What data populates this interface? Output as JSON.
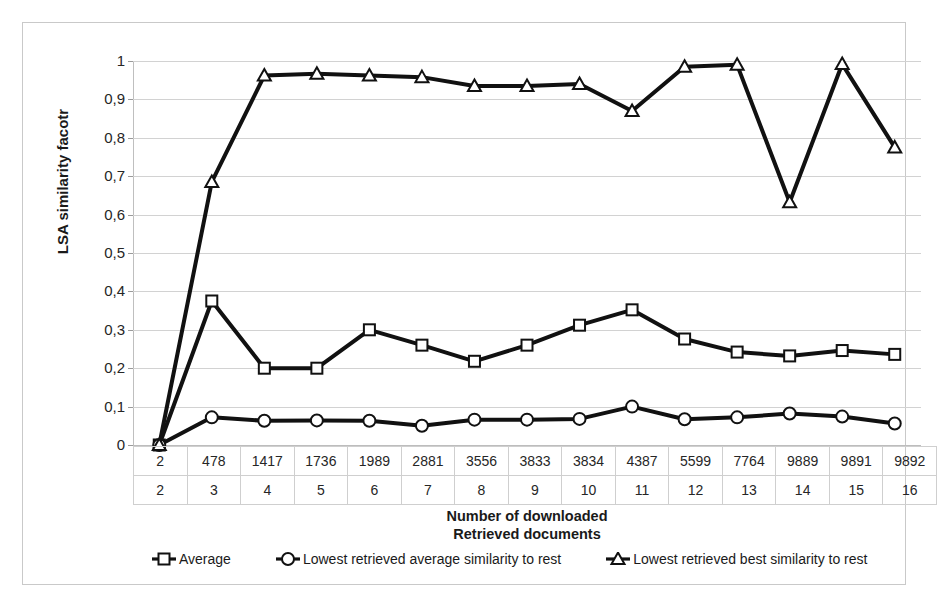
{
  "chart_data": {
    "type": "line",
    "title": "",
    "xlabel": "Number of downloaded\nRetrieved documents",
    "ylabel": "LSA similarity facotr",
    "ylim": [
      0,
      1
    ],
    "grid": true,
    "legend_position": "bottom",
    "y_ticks": [
      "0",
      "0,1",
      "0,2",
      "0,3",
      "0,4",
      "0,5",
      "0,6",
      "0,7",
      "0,8",
      "0,9",
      "1"
    ],
    "y_tick_values": [
      0,
      0.1,
      0.2,
      0.3,
      0.4,
      0.5,
      0.6,
      0.7,
      0.8,
      0.9,
      1
    ],
    "categories": [
      "2",
      "478",
      "1417",
      "1736",
      "1989",
      "2881",
      "3556",
      "3833",
      "3834",
      "4387",
      "5599",
      "7764",
      "9889",
      "9891",
      "9892"
    ],
    "categories_secondary": [
      "2",
      "3",
      "4",
      "5",
      "6",
      "7",
      "8",
      "9",
      "10",
      "11",
      "12",
      "13",
      "14",
      "15",
      "16"
    ],
    "series": [
      {
        "name": "Average",
        "marker": "square",
        "values": [
          0.0,
          0.375,
          0.2,
          0.2,
          0.3,
          0.26,
          0.218,
          0.26,
          0.312,
          0.352,
          0.276,
          0.242,
          0.232,
          0.246,
          0.236
        ]
      },
      {
        "name": "Lowest retrieved average similarity to rest",
        "marker": "circle",
        "values": [
          0.0,
          0.072,
          0.063,
          0.064,
          0.063,
          0.05,
          0.066,
          0.066,
          0.068,
          0.1,
          0.067,
          0.072,
          0.082,
          0.074,
          0.056
        ]
      },
      {
        "name": "Lowest retrieved best similarity to rest",
        "marker": "triangle",
        "values": [
          0.0,
          0.685,
          0.962,
          0.967,
          0.962,
          0.958,
          0.935,
          0.935,
          0.94,
          0.87,
          0.985,
          0.99,
          0.632,
          0.992,
          0.775
        ]
      }
    ]
  },
  "axis": {
    "y_title": "LSA similarity facotr",
    "x_title_line1": "Number of downloaded",
    "x_title_line2": "Retrieved documents"
  },
  "table": {
    "row_docs": [
      "2",
      "478",
      "1417",
      "1736",
      "1989",
      "2881",
      "3556",
      "3833",
      "3834",
      "4387",
      "5599",
      "7764",
      "9889",
      "9891",
      "9892"
    ],
    "row_index": [
      "2",
      "3",
      "4",
      "5",
      "6",
      "7",
      "8",
      "9",
      "10",
      "11",
      "12",
      "13",
      "14",
      "15",
      "16"
    ]
  },
  "legend": {
    "items": [
      {
        "label": "Average",
        "marker": "square"
      },
      {
        "label": "Lowest retrieved average similarity to rest",
        "marker": "circle"
      },
      {
        "label": "Lowest retrieved best similarity to rest",
        "marker": "triangle"
      }
    ]
  },
  "colors": {
    "line": "#111111",
    "marker_fill": "#ffffff",
    "grid": "#d2d2d2",
    "frame": "#c9c9c9",
    "text": "#1a1a1a"
  }
}
